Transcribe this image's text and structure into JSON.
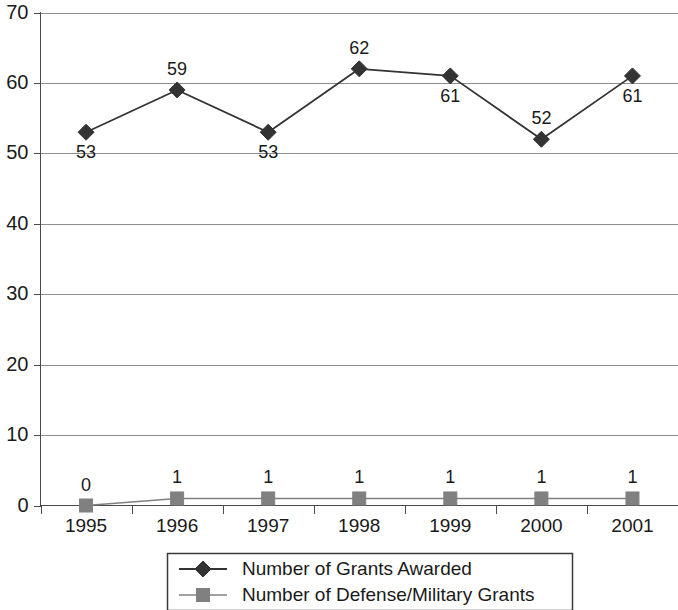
{
  "chart_data": {
    "type": "line",
    "title": "",
    "subtitle": "",
    "xlabel": "",
    "ylabel": "",
    "categories": [
      "1995",
      "1996",
      "1997",
      "1998",
      "1999",
      "2000",
      "2001"
    ],
    "ylim": [
      0,
      70
    ],
    "y_ticks": [
      0,
      10,
      20,
      30,
      40,
      50,
      60,
      70
    ],
    "y_tick_labels": [
      "0",
      "10",
      "20",
      "30",
      "40",
      "50",
      "60",
      "70"
    ],
    "grid": true,
    "grid_axis": "y",
    "legend_position": "bottom-center",
    "series": [
      {
        "name": "Number of Grants Awarded",
        "marker": "diamond",
        "color": "#333333",
        "values": [
          53,
          59,
          53,
          62,
          61,
          52,
          61
        ],
        "data_labels": [
          "53",
          "59",
          "53",
          "62",
          "61",
          "52",
          "61"
        ],
        "label_placement": [
          "below",
          "above",
          "below",
          "above",
          "below",
          "above",
          "below"
        ]
      },
      {
        "name": "Number of Defense/Military Grants",
        "marker": "square",
        "color": "#808080",
        "values": [
          0,
          1,
          1,
          1,
          1,
          1,
          1
        ],
        "data_labels": [
          "0",
          "1",
          "1",
          "1",
          "1",
          "1",
          "1"
        ],
        "label_placement": [
          "above",
          "above",
          "above",
          "above",
          "above",
          "above",
          "above"
        ]
      }
    ]
  },
  "legend": {
    "entries": [
      {
        "label": "Number of Grants Awarded",
        "marker": "diamond",
        "color": "#333333"
      },
      {
        "label": "Number of Defense/Military Grants",
        "marker": "square",
        "color": "#808080"
      }
    ]
  },
  "colors": {
    "background": "#ffffff",
    "text": "#1a1a1a",
    "gridline": "#8d8d8d",
    "axis": "#4a4a4a",
    "series_primary": "#333333",
    "series_secondary": "#808080"
  }
}
